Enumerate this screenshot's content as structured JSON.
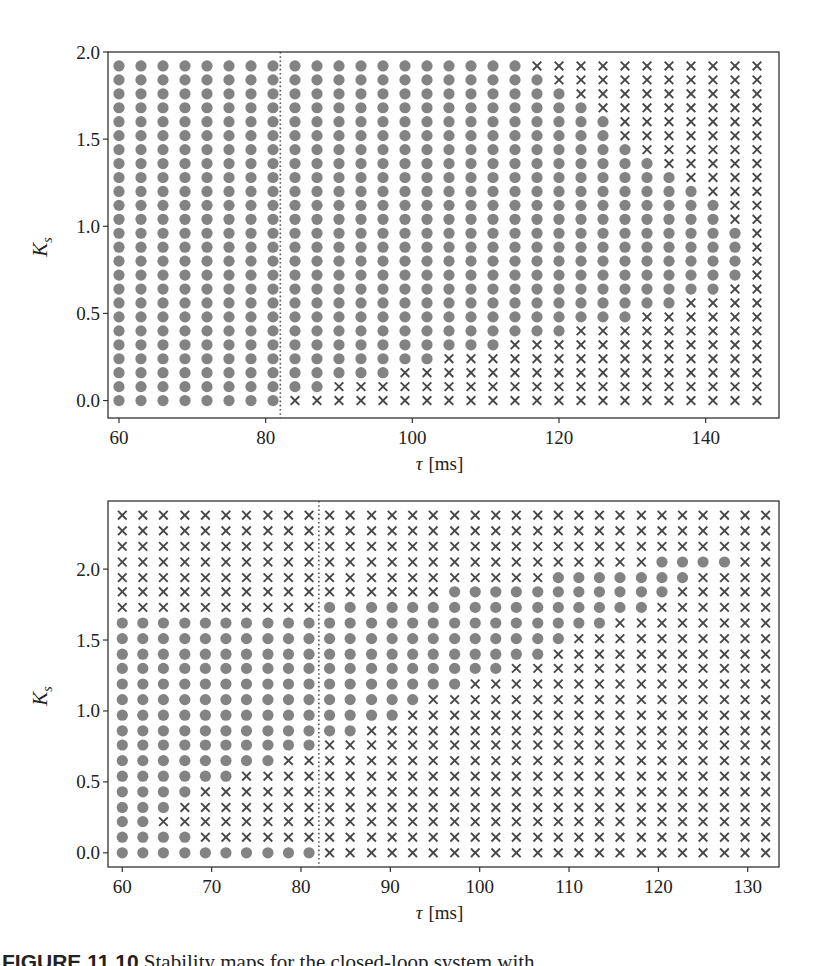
{
  "figure": {
    "caption_label": "FIGURE 11.10",
    "caption_text": "Stability maps for the closed-loop system with ..."
  },
  "colors": {
    "stable_marker": "#838383",
    "unstable_marker": "#474747",
    "axes": "#333333",
    "threshold_line": "#555555"
  },
  "chart_data": [
    {
      "type": "scatter",
      "title": "",
      "xlabel": "τ [ms]",
      "ylabel": "K_s",
      "xlim": [
        58.5,
        150
      ],
      "ylim": [
        -0.1,
        2.0
      ],
      "xticks": [
        60,
        80,
        100,
        120,
        140
      ],
      "xtick_labels": [
        "60",
        "80",
        "100",
        "120",
        "140"
      ],
      "yticks": [
        0.0,
        0.5,
        1.0,
        1.5,
        2.0
      ],
      "ytick_labels": [
        "0.0",
        "0.5",
        "1.0",
        "1.5",
        "2.0"
      ],
      "grid": false,
      "legend": null,
      "threshold_tau_ms": 82,
      "threshold_style": "dotted vertical line",
      "markers": {
        "o": "stable (gray filled circle)",
        "x": "unstable (dark cross)"
      },
      "x": [
        60,
        63,
        66,
        69,
        72,
        75,
        78,
        81,
        84,
        87,
        90,
        93,
        96,
        99,
        102,
        105,
        108,
        111,
        114,
        117,
        120,
        123,
        126,
        129,
        132,
        135,
        138,
        141,
        144,
        147
      ],
      "y_top_to_bottom": [
        1.92,
        1.84,
        1.76,
        1.68,
        1.6,
        1.52,
        1.44,
        1.36,
        1.28,
        1.2,
        1.12,
        1.04,
        0.96,
        0.88,
        0.8,
        0.72,
        0.64,
        0.56,
        0.48,
        0.4,
        0.32,
        0.24,
        0.16,
        0.08,
        0.0
      ],
      "grid_rows_top_to_bottom": [
        "oooooooooooooooooooxxxxxxxxxxx",
        "ooooooooooooooooooooxxxxxxxxxx",
        "oooooooooooooooooooooxxxxxxxxx",
        "ooooooooooooooooooooooxxxxxxxx",
        "oooooooooooooooooooooooxxxxxxx",
        "oooooooooooooooooooooooxxxxxxx",
        "ooooooooooooooooooooooooxxxxxx",
        "oooooooooooooooooooooooooxxxxx",
        "ooooooooooooooooooooooooooxxxx",
        "oooooooooooooooooooooooooooxxx",
        "ooooooooooooooooooooooooooooxx",
        "ooooooooooooooooooooooooooooxx",
        "oooooooooooooooooooooooooooooх",
        "ooooooooooooooooooooooooooooox",
        "ooooooooooooooooooooooooooooox",
        "ooooooooooooooooooooooooooooox",
        "ooooooooooooooooooooooooooooxx",
        "ooooooooooooooooooooooooooxxxx",
        "ooooooooooooooooooooooooxxxxxx",
        "oooooooooooooooooooooxxxxxxxxx",
        "ooooooooooooooooooxxxxxxxxxxxx",
        "oooooooooooooooxxxxxxxxxxxxxxx",
        "oooooooooooooxxxxxxxxxxxxxxxxx",
        "ooooooooooxxxxxxxxxxxxxxxxxxxx",
        "ooooooooxxxxxxxxxxxxxxxxxxxxxx"
      ]
    },
    {
      "type": "scatter",
      "title": "",
      "xlabel": "τ [ms]",
      "ylabel": "K_s",
      "xlim": [
        58.4,
        133.5
      ],
      "ylim": [
        -0.1,
        2.48
      ],
      "xticks": [
        60,
        70,
        80,
        90,
        100,
        110,
        120,
        130
      ],
      "xtick_labels": [
        "60",
        "70",
        "80",
        "90",
        "100",
        "110",
        "120",
        "130"
      ],
      "yticks": [
        0.0,
        0.5,
        1.0,
        1.5,
        2.0
      ],
      "ytick_labels": [
        "0.0",
        "0.5",
        "1.0",
        "1.5",
        "2.0"
      ],
      "grid": false,
      "legend": null,
      "threshold_tau_ms": 82,
      "threshold_style": "dotted vertical line",
      "markers": {
        "o": "stable (gray filled circle)",
        "x": "unstable (dark cross)"
      },
      "x": [
        60.0,
        62.3,
        64.6,
        67.0,
        69.3,
        71.6,
        73.9,
        76.3,
        78.6,
        80.9,
        83.2,
        85.5,
        87.9,
        90.2,
        92.5,
        94.8,
        97.2,
        99.5,
        101.8,
        104.1,
        106.5,
        108.8,
        111.1,
        113.4,
        115.7,
        118.1,
        120.4,
        122.7,
        125.0,
        127.4,
        129.7,
        132.0
      ],
      "y_top_to_bottom": [
        2.38,
        2.27,
        2.16,
        2.05,
        1.94,
        1.84,
        1.73,
        1.62,
        1.51,
        1.4,
        1.3,
        1.19,
        1.08,
        0.97,
        0.86,
        0.76,
        0.65,
        0.54,
        0.43,
        0.32,
        0.22,
        0.11,
        0.0
      ],
      "grid_rows_top_to_bottom": [
        "xxxxxxxxxxxxxxxxxxxxxxxxxxxxxxxx",
        "xxxxxxxxxxxxxxxxxxxxxxxxxxxxxxxx",
        "xxxxxxxxxxxxxxxxxxxxxxxxxxxxxxxx",
        "xxxxxxxxxxxxxxxxxxxxxxxxxxooooxx",
        "xxxxxxxxxxxxxxxxxxxxxoooooooxxx",
        "xxxxxxxxxxxxxxxxoooooooooooxxxxx",
        "xxxxxxxxxxooooooooooooooooxxxxxx",
        "ooooooooooooooooooooooooxxxxxxxx",
        "ooooooooooooooooooooooxxxxxxxxxx",
        "oooooooooooooooooooooxxxxxxxxxxx",
        "oooooooooooooooooooxxxxxxxxxxxxx",
        "oooooooooooooooooxxxxxxxxxxxxxxx",
        "oooooooooooooooxxxxxxxxxxxxxxxxx",
        "ooooooooooooooxxxxxxxxxxxxxxxxxx",
        "ooooooooooooxxxxxxxxxxxxxxxxxxxx",
        "ooooooooooxxxxxxxxxxxxxxxxxxxxxx",
        "ooooooooxxxxxxxxxxxxxxxxxxxxxxxx",
        "ooooooxxxxxxxxxxxxxxxxxxxxxxxxxx",
        "ooooxxxxxxxxxxxxxxxxxxxxxxxxxxxx",
        "oooxxxxxxxxxxxxxxxxxxxxxxxxxxxxx",
        "ooxxxxxxxxxxxxxxxxxxxxxxxxxxxxxx",
        "ooooxxxxxxxxxxxxxxxxxxxxxxxxxxxx",
        "ooooooooooxxxxxxxxxxxxxxxxxxxxxx"
      ]
    }
  ]
}
